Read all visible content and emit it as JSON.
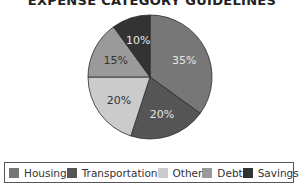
{
  "chart_data": {
    "type": "pie",
    "title": "EXPENSE CATEGORY GUIDELINES",
    "categories": [
      "Housing",
      "Transportation",
      "Other",
      "Debt",
      "Savings"
    ],
    "values": [
      35,
      20,
      20,
      15,
      10
    ],
    "labels": [
      "35%",
      "20%",
      "20%",
      "15%",
      "10%"
    ],
    "colors": [
      "#777777",
      "#555555",
      "#cbcbcb",
      "#9a9a9a",
      "#333333"
    ],
    "label_colors": [
      "#e6e6e6",
      "#e6e6e6",
      "#333333",
      "#333333",
      "#e6e6e6"
    ],
    "start_angle": "top",
    "direction": "clockwise",
    "legend_position": "bottom"
  }
}
